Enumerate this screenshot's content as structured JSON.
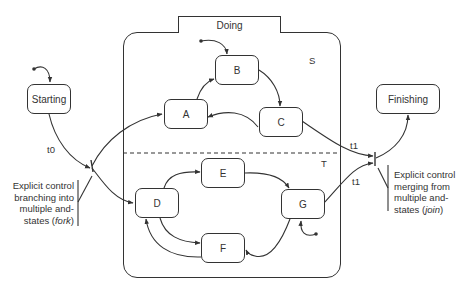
{
  "composite_state": {
    "name": "Doing",
    "regions": [
      {
        "label": "S",
        "states": [
          "A",
          "B",
          "C"
        ]
      },
      {
        "label": "T",
        "states": [
          "D",
          "E",
          "F",
          "G"
        ]
      }
    ]
  },
  "states": {
    "starting": "Starting",
    "finishing": "Finishing",
    "a": "A",
    "b": "B",
    "c": "C",
    "d": "D",
    "e": "E",
    "f": "F",
    "g": "G"
  },
  "transitions": {
    "t0": "t0",
    "t1_upper": "t1",
    "t1_lower": "t1"
  },
  "annotations": {
    "fork": {
      "line1": "Explicit control",
      "line2": "branching into",
      "line3": "multiple and-",
      "line4_prefix": "states (",
      "line4_em": "fork",
      "line4_suffix": ")"
    },
    "join": {
      "line1": "Explicit control",
      "line2": "merging from",
      "line3": "multiple and-",
      "line4_prefix": "states (",
      "line4_em": "join",
      "line4_suffix": ")"
    }
  },
  "colors": {
    "stroke": "#333333",
    "background": "#ffffff"
  }
}
